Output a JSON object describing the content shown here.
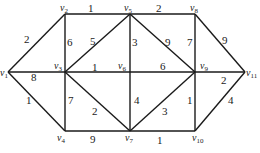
{
  "graph": {
    "nodes": [
      {
        "id": "v1",
        "name": "v",
        "sub": "1",
        "x": 8,
        "y": 72,
        "lx": 0,
        "ly": 76
      },
      {
        "id": "v2",
        "name": "v",
        "sub": "2",
        "x": 65,
        "y": 14,
        "lx": 60,
        "ly": 11
      },
      {
        "id": "v3",
        "name": "v",
        "sub": "3",
        "x": 65,
        "y": 72,
        "lx": 54,
        "ly": 69
      },
      {
        "id": "v4",
        "name": "v",
        "sub": "4",
        "x": 65,
        "y": 131,
        "lx": 57,
        "ly": 141
      },
      {
        "id": "v5",
        "name": "v",
        "sub": "5",
        "x": 130,
        "y": 14,
        "lx": 124,
        "ly": 11
      },
      {
        "id": "v6",
        "name": "v",
        "sub": "6",
        "x": 130,
        "y": 72,
        "lx": 118,
        "ly": 69
      },
      {
        "id": "v7",
        "name": "v",
        "sub": "7",
        "x": 130,
        "y": 131,
        "lx": 125,
        "ly": 141
      },
      {
        "id": "v8",
        "name": "v",
        "sub": "8",
        "x": 195,
        "y": 14,
        "lx": 190,
        "ly": 11
      },
      {
        "id": "v9",
        "name": "v",
        "sub": "9",
        "x": 195,
        "y": 72,
        "lx": 200,
        "ly": 69
      },
      {
        "id": "v10",
        "name": "v",
        "sub": "10",
        "x": 195,
        "y": 131,
        "lx": 192,
        "ly": 141
      },
      {
        "id": "v11",
        "name": "v",
        "sub": "11",
        "x": 245,
        "y": 72,
        "lx": 246,
        "ly": 76
      }
    ],
    "edges": [
      {
        "from": "v1",
        "to": "v2",
        "weight": "2",
        "lx": 24,
        "ly": 43
      },
      {
        "from": "v1",
        "to": "v3",
        "weight": "8",
        "lx": 31,
        "ly": 81
      },
      {
        "from": "v1",
        "to": "v4",
        "weight": "1",
        "lx": 26,
        "ly": 104
      },
      {
        "from": "v2",
        "to": "v5",
        "weight": "1",
        "lx": 88,
        "ly": 12
      },
      {
        "from": "v2",
        "to": "v3",
        "weight": "6",
        "lx": 67,
        "ly": 46
      },
      {
        "from": "v3",
        "to": "v5",
        "weight": "5",
        "lx": 90,
        "ly": 45
      },
      {
        "from": "v3",
        "to": "v6",
        "weight": "1",
        "lx": 92,
        "ly": 71
      },
      {
        "from": "v3",
        "to": "v4",
        "weight": "7",
        "lx": 68,
        "ly": 104
      },
      {
        "from": "v3",
        "to": "v7",
        "weight": "2",
        "lx": 92,
        "ly": 115
      },
      {
        "from": "v5",
        "to": "v6",
        "weight": "3",
        "lx": 132,
        "ly": 46
      },
      {
        "from": "v5",
        "to": "v8",
        "weight": "2",
        "lx": 156,
        "ly": 12
      },
      {
        "from": "v5",
        "to": "v9",
        "weight": "9",
        "lx": 165,
        "ly": 46
      },
      {
        "from": "v8",
        "to": "v9",
        "weight": "7",
        "lx": 187,
        "ly": 46
      },
      {
        "from": "v8",
        "to": "v11",
        "weight": "9",
        "lx": 222,
        "ly": 44
      },
      {
        "from": "v6",
        "to": "v9",
        "weight": "6",
        "lx": 160,
        "ly": 70
      },
      {
        "from": "v6",
        "to": "v7",
        "weight": "4",
        "lx": 134,
        "ly": 104
      },
      {
        "from": "v4",
        "to": "v7",
        "weight": "9",
        "lx": 90,
        "ly": 143
      },
      {
        "from": "v7",
        "to": "v9",
        "weight": "3",
        "lx": 162,
        "ly": 115
      },
      {
        "from": "v9",
        "to": "v10",
        "weight": "1",
        "lx": 187,
        "ly": 104
      },
      {
        "from": "v9",
        "to": "v11",
        "weight": "2",
        "lx": 221,
        "ly": 84
      },
      {
        "from": "v7",
        "to": "v10",
        "weight": "1",
        "lx": 157,
        "ly": 144
      },
      {
        "from": "v10",
        "to": "v11",
        "weight": "4",
        "lx": 228,
        "ly": 104
      }
    ]
  }
}
